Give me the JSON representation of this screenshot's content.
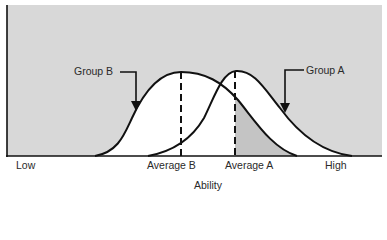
{
  "diagram": {
    "type": "distribution-comparison",
    "colors": {
      "background": "#d8d8d8",
      "curve_fill": "#ffffff",
      "overlap_shade": "#c4c4c4",
      "stroke": "#111111"
    },
    "groups": [
      {
        "name": "Group B",
        "label": "Group B",
        "mean_label": "Average B"
      },
      {
        "name": "Group A",
        "label": "Group A",
        "mean_label": "Average A"
      }
    ],
    "axis": {
      "title": "Ability",
      "low_label": "Low",
      "high_label": "High"
    }
  }
}
